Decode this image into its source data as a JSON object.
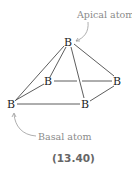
{
  "figure": {
    "atoms": [
      {
        "id": "apical",
        "symbol": "B",
        "x": 69,
        "y": 45
      },
      {
        "id": "basal-back-left",
        "symbol": "B",
        "x": 48,
        "y": 85
      },
      {
        "id": "basal-back-right",
        "symbol": "B",
        "x": 117,
        "y": 85
      },
      {
        "id": "basal-front-left",
        "symbol": "B",
        "x": 11,
        "y": 108
      },
      {
        "id": "basal-front-right",
        "symbol": "B",
        "x": 85,
        "y": 108
      }
    ],
    "labels": {
      "apical": "Apical atom",
      "basal": "Basal atom"
    },
    "equation_number": "(13.40)",
    "colors": {
      "bond": "#333333",
      "label": "#8a8a8a",
      "equation": "#666666"
    }
  }
}
